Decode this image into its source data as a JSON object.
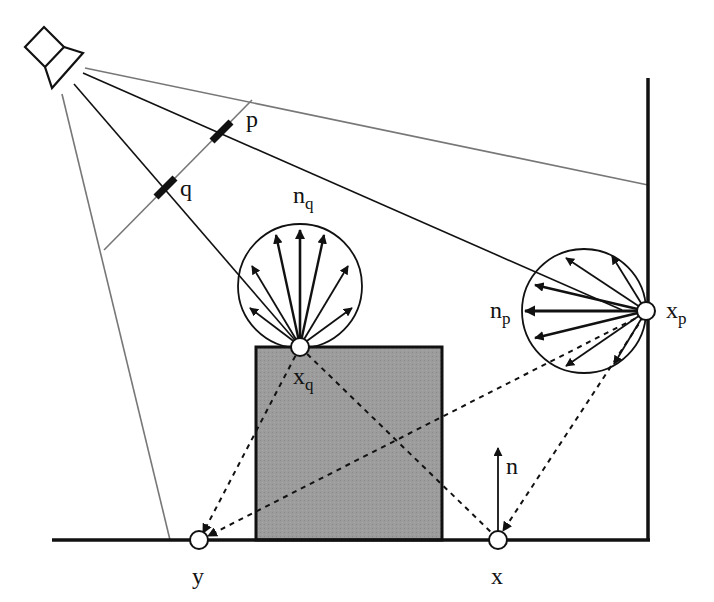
{
  "figure": {
    "type": "photon-mapping / light-transport illustration",
    "colors": {
      "ink": "#111111",
      "gray_ray": "#777777",
      "box_fill": "#9a9a9a",
      "point_fill": "#ffffff"
    }
  },
  "labels": {
    "p": "p",
    "q": "q",
    "n_q": {
      "base": "n",
      "sub": "q"
    },
    "n_p": {
      "base": "n",
      "sub": "p"
    },
    "x_q": {
      "base": "x",
      "sub": "q"
    },
    "x_p": {
      "base": "x",
      "sub": "p"
    },
    "n": "n",
    "x": "x",
    "y": "y"
  },
  "elements": {
    "light_source": "spotlight-icon at top left",
    "frustum": "two gray lines bounding the light cone",
    "image_plane": "gray line crossing the frustum containing pixels p and q",
    "hemisphere_q": "hemisphere of reflected direction arrows above point x_q (normal pointing up)",
    "hemisphere_p": "hemisphere of reflected direction arrows left of point x_p on wall (normal pointing left)",
    "box": "gray occluding box on the floor",
    "floor": "thick horizontal line",
    "wall": "thick vertical line on right"
  }
}
